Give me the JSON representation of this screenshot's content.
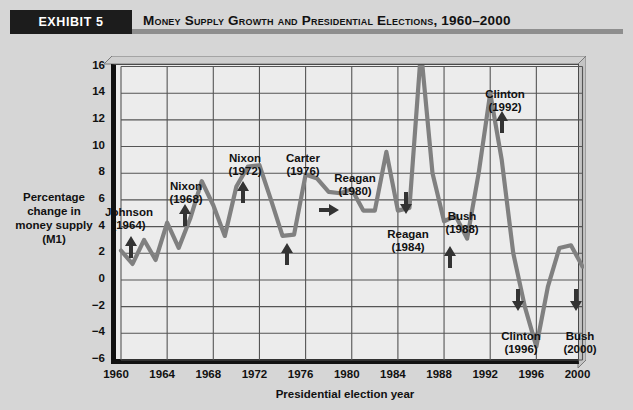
{
  "header": {
    "exhibit_label": "EXHIBIT 5",
    "title": "Money Supply Growth and Presidential Elections, 1960–2000"
  },
  "axes": {
    "y_title_line1": "Percentage",
    "y_title_line2": "change in",
    "y_title_line3": "money supply",
    "y_title_line4": "(M1)",
    "x_title": "Presidential election year",
    "y_ticks": [
      "16",
      "14",
      "12",
      "10",
      "8",
      "6",
      "4",
      "2",
      "0",
      "−2",
      "−4",
      "−6"
    ],
    "x_ticks": [
      "1960",
      "1964",
      "1968",
      "1972",
      "1976",
      "1980",
      "1984",
      "1988",
      "1992",
      "1996",
      "2000"
    ]
  },
  "annotations": [
    {
      "name": "Johnson",
      "year": "(1964)",
      "arrow": "up"
    },
    {
      "name": "Nixon",
      "year": "(1968)",
      "arrow": "up"
    },
    {
      "name": "Nixon",
      "year": "(1972)",
      "arrow": "up"
    },
    {
      "name": "Carter",
      "year": "(1976)",
      "arrow": "up"
    },
    {
      "name": "Reagan",
      "year": "(1980)",
      "arrow": "right"
    },
    {
      "name": "Reagan",
      "year": "(1984)",
      "arrow": "down"
    },
    {
      "name": "Bush",
      "year": "(1988)",
      "arrow": "up"
    },
    {
      "name": "Clinton",
      "year": "(1992)",
      "arrow": "up"
    },
    {
      "name": "Clinton",
      "year": "(1996)",
      "arrow": "down"
    },
    {
      "name": "Bush",
      "year": "(2000)",
      "arrow": "down"
    }
  ],
  "colors": {
    "page_background": "#d6d6d6",
    "plot_background": "#ececec",
    "series_line": "#808080",
    "grid": "#555555",
    "axis": "#111111",
    "band": "#1c1c1c",
    "rule": "#8e8e8e"
  },
  "chart_data": {
    "type": "line",
    "title": "Money Supply Growth and Presidential Elections, 1960–2000",
    "xlabel": "Presidential election year",
    "ylabel": "Percentage change in money supply (M1)",
    "xlim": [
      1960,
      2000
    ],
    "ylim": [
      -6,
      16
    ],
    "ytick_step": 2,
    "xtick_step": 4,
    "grid": true,
    "legend": "none",
    "x": [
      1960,
      1961,
      1962,
      1963,
      1964,
      1965,
      1966,
      1967,
      1968,
      1969,
      1970,
      1971,
      1972,
      1973,
      1974,
      1975,
      1976,
      1977,
      1978,
      1979,
      1980,
      1981,
      1982,
      1983,
      1984,
      1985,
      1986,
      1987,
      1988,
      1989,
      1990,
      1991,
      1992,
      1993,
      1994,
      1995,
      1996,
      1997,
      1998,
      1999,
      2000
    ],
    "values": [
      2.2,
      1.2,
      3.0,
      1.5,
      4.3,
      2.4,
      4.6,
      7.4,
      5.6,
      3.3,
      7.0,
      8.5,
      8.6,
      6.0,
      3.3,
      3.4,
      7.9,
      7.6,
      6.6,
      6.5,
      6.8,
      5.2,
      5.2,
      9.6,
      5.2,
      5.4,
      17.2,
      8.0,
      4.4,
      4.8,
      3.1,
      8.0,
      14.0,
      9.0,
      2.0,
      -2.0,
      -5.0,
      -0.5,
      2.4,
      2.6,
      1.0
    ],
    "annotation_points": [
      {
        "label": "Johnson (1964)",
        "x": 1964,
        "y": 4.3,
        "arrow": "up"
      },
      {
        "label": "Nixon (1968)",
        "x": 1968,
        "y": 5.6,
        "arrow": "up"
      },
      {
        "label": "Nixon (1972)",
        "x": 1972,
        "y": 8.6,
        "arrow": "up"
      },
      {
        "label": "Carter (1976)",
        "x": 1976,
        "y": 7.9,
        "arrow": "up"
      },
      {
        "label": "Reagan (1980)",
        "x": 1980,
        "y": 6.8,
        "arrow": "right"
      },
      {
        "label": "Reagan (1984)",
        "x": 1984,
        "y": 5.2,
        "arrow": "down"
      },
      {
        "label": "Bush (1988)",
        "x": 1988,
        "y": 4.4,
        "arrow": "up"
      },
      {
        "label": "Clinton (1992)",
        "x": 1992,
        "y": 14.0,
        "arrow": "up"
      },
      {
        "label": "Clinton (1996)",
        "x": 1996,
        "y": -5.0,
        "arrow": "down"
      },
      {
        "label": "Bush (2000)",
        "x": 2000,
        "y": 1.0,
        "arrow": "down"
      }
    ]
  }
}
